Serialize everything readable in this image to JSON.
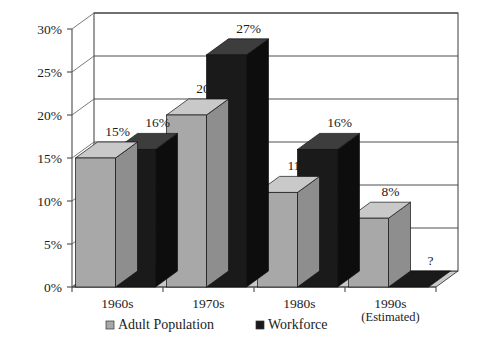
{
  "chart_data": {
    "type": "bar",
    "title": "",
    "subtitle": "",
    "xlabel": "",
    "ylabel": "",
    "categories": [
      "1960s",
      "1970s",
      "1980s",
      "1990s"
    ],
    "category_sublabels": [
      "",
      "",
      "",
      "(Estimated)"
    ],
    "series": [
      {
        "name": "Adult Population",
        "color": "#a8a8a8",
        "values": [
          15,
          20,
          11,
          8
        ],
        "labels": [
          "15%",
          "20%",
          "11%",
          "8%"
        ]
      },
      {
        "name": "Workforce",
        "color": "#1a1a1a",
        "values": [
          16,
          27,
          16,
          0
        ],
        "labels": [
          "16%",
          "27%",
          "16%",
          "?"
        ]
      }
    ],
    "ylim": [
      0,
      30
    ],
    "ytick_values": [
      0,
      5,
      10,
      15,
      20,
      25,
      30
    ],
    "ytick_labels": [
      "0%",
      "5%",
      "10%",
      "15%",
      "20%",
      "25%",
      "30%"
    ],
    "grid": true,
    "grid_axis": "y",
    "legend_position": "bottom",
    "three_d": true
  },
  "legend": {
    "items": [
      {
        "label": "Adult Population",
        "marker": "gray-square-marker",
        "color": "#a8a8a8"
      },
      {
        "label": "Workforce",
        "marker": "black-square-marker",
        "color": "#1a1a1a"
      }
    ]
  },
  "colors": {
    "adult_population": "#a8a8a8",
    "adult_population_top": "#c9c9c9",
    "adult_population_side": "#8e8e8e",
    "workforce": "#1a1a1a",
    "workforce_top": "#3d3d3d",
    "workforce_side": "#0d0d0d",
    "floor": "#c9c9c9",
    "wall": "#ffffff",
    "line": "#3a3a3a",
    "text": "#1c1c1c"
  }
}
